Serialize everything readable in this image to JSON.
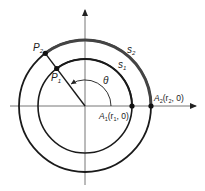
{
  "diagram": {
    "origin": [
      85,
      106
    ],
    "colors": {
      "stroke": "#1a1a1a",
      "axis": "#777777",
      "arc_highlight": "#444444",
      "background": "#ffffff"
    },
    "inner_circle": {
      "radius": 47,
      "point_label": "A",
      "point_sub": "1",
      "coord_prefix": "(r",
      "coord_sub": "1",
      "coord_suffix": ", 0)"
    },
    "outer_circle": {
      "radius": 66,
      "point_label": "A",
      "point_sub": "2",
      "coord_prefix": "(r",
      "coord_sub": "2",
      "coord_suffix": ", 0)"
    },
    "points": {
      "p1": {
        "label": "P",
        "sub": "1"
      },
      "p2": {
        "label": "P",
        "sub": "2"
      }
    },
    "arcs": {
      "s1": {
        "label": "s",
        "sub": "1"
      },
      "s2": {
        "label": "s",
        "sub": "2"
      }
    },
    "angle": {
      "label": "θ",
      "degrees": 127
    }
  }
}
